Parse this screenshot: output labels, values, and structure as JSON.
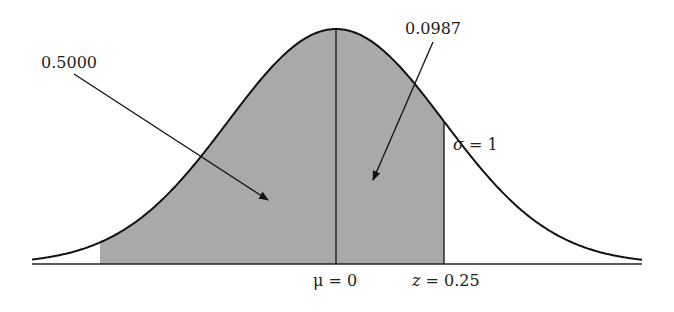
{
  "diagram": {
    "type": "normal-distribution",
    "mean_label": "μ = 0",
    "z_label_var": "z",
    "z_label_val": " = 0.25",
    "sigma_label_var": "σ",
    "sigma_label_val": " = 1",
    "area_left_label": "0.5000",
    "area_right_label": "0.0987",
    "colors": {
      "fill": "#a9a9a9",
      "stroke": "#111111"
    }
  }
}
